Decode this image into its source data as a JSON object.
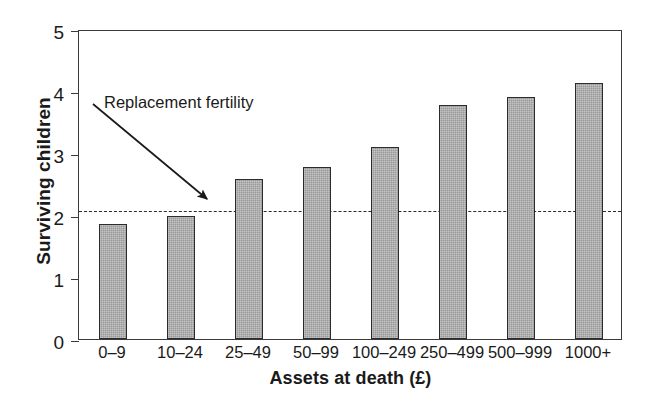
{
  "chart_data": {
    "type": "bar",
    "title": "",
    "xlabel": "Assets at death (£)",
    "ylabel": "Surviving children",
    "categories": [
      "0–9",
      "10–24",
      "25–49",
      "50–99",
      "100–249",
      "250–499",
      "500–999",
      "1000+"
    ],
    "values": [
      1.85,
      1.98,
      2.58,
      2.77,
      3.09,
      3.77,
      3.9,
      4.13
    ],
    "ylim": [
      0,
      5
    ],
    "yticks": [
      0,
      1,
      2,
      3,
      4,
      5
    ],
    "ytick_labels": [
      "0",
      "1",
      "2",
      "3",
      "4",
      "5"
    ],
    "grid": false,
    "legend": "none",
    "annotations": [
      {
        "text": "Replacement fertility",
        "target_value": 2.1,
        "kind": "arrow-callout"
      }
    ],
    "reference_lines": [
      {
        "name": "replacement-fertility",
        "value": 2.1,
        "style": "dashed"
      }
    ],
    "colors": {
      "bar_fill": "#9a9a9a",
      "bar_edge": "#2b2b2b",
      "axis": "#3a3a3a",
      "text": "#1a1a1a",
      "background": "#ffffff"
    }
  }
}
